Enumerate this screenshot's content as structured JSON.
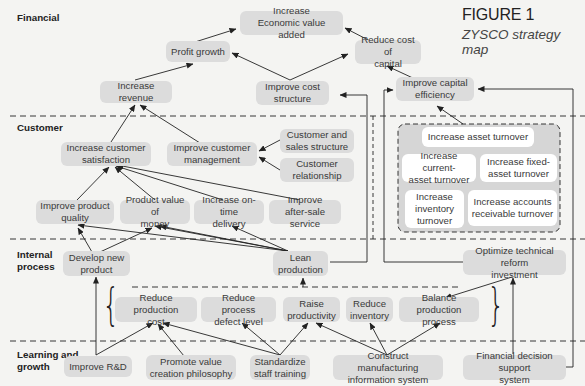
{
  "figure": {
    "label": "FIGURE 1",
    "title": "ZYSCO strategy map"
  },
  "perspectives": {
    "financial": "Financial",
    "customer": "Customer",
    "internal_process": "Internal\nprocess",
    "learning_growth": "Learning and\ngrowth"
  },
  "financial": {
    "increase_eva": "Increase\nEconomic value added",
    "profit_growth": "Profit growth",
    "reduce_cost_of_capital": "Reduce cost of\ncapital",
    "increase_revenue": "Increase revenue",
    "improve_cost_structure": "Improve cost\nstructure",
    "improve_capital_efficiency": "Improve capital\nefficiency"
  },
  "customer": {
    "increase_customer_satisfaction": "Increase customer\nsatisfaction",
    "improve_customer_management": "Improve customer\nmanagement",
    "customer_sales_structure": "Customer and\nsales structure",
    "customer_relationship": "Customer\nrelationship",
    "improve_product_quality": "Improve product\nquality",
    "product_value_of_money": "Product value of\nmoney",
    "increase_on_time_delivery": "Increase on-time\ndelivery",
    "improve_after_sale_service": "Improve\nafter-sale service"
  },
  "asset_turnover": {
    "increase_asset_turnover": "Increase asset turnover",
    "current_asset_turnover": "Increase current-\nasset turnover",
    "fixed_asset_turnover": "Increase fixed-\nasset turnover",
    "inventory_turnover": "Increase\ninventory\nturnover",
    "accounts_receivable_turnover": "Increase accounts\nreceivable turnover"
  },
  "internal_process": {
    "develop_new_product": "Develop new\nproduct",
    "lean_production": "Lean\nproduction",
    "optimize_technical_reform": "Optimize technical reform\ninvestment",
    "reduce_production_cost": "Reduce production\ncost",
    "reduce_process_defect": "Reduce process\ndefect level",
    "raise_productivity": "Raise\nproductivity",
    "reduce_inventory": "Reduce\ninventory",
    "balance_production": "Balance production\nprocess"
  },
  "learning_growth": {
    "improve_rd": "Improve R&D",
    "promote_value_creation": "Promote value\ncreation philosophy",
    "standardize_training": "Standardize\nstaff training",
    "construct_mis": "Construct manufacturing\ninformation system",
    "financial_decision_support": "Financial decision support\nsystem"
  },
  "colors": {
    "background": "#f4f4f2",
    "node_fill": "#dcdcdc",
    "asset_group_fill": "#d6d6d6",
    "asset_node_fill": "#ffffff",
    "line": "#222222"
  }
}
